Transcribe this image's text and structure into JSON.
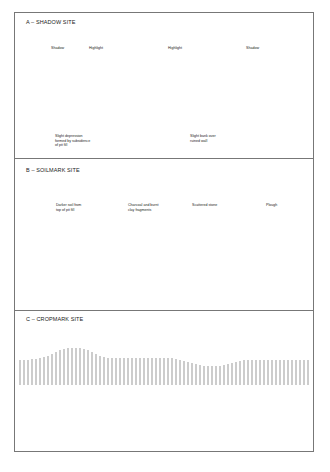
{
  "figure": {
    "panels": [
      {
        "id": "A",
        "title": "A – SHADOW SITE",
        "labels": {
          "shadow_left": "Shadow",
          "highlight_left": "Highlight",
          "highlight_right": "Highlight",
          "shadow_right": "Shadow",
          "depression": "Slight depression\nformed by subsidence\nof pit fill",
          "bank": "Slight bank over\nruined wall"
        },
        "icon": "aircraft-icon"
      },
      {
        "id": "B",
        "title": "B – SOILMARK SITE",
        "labels": {
          "darker_soil": "Darker soil from\ntop of pit fill",
          "charcoal": "Charcoal and burnt\nclay fragments",
          "stone": "Scattered stone",
          "plough": "Plough"
        }
      },
      {
        "id": "C",
        "title": "C – CROPMARK SITE",
        "labels": {}
      }
    ],
    "colors": {
      "line": "#333333",
      "border": "#777777",
      "hatch": "#9a9a9a",
      "background": "#ffffff"
    }
  }
}
